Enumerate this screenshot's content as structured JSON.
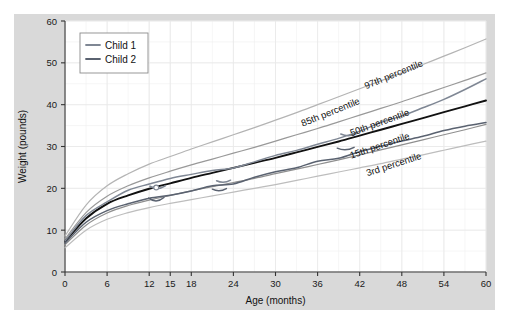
{
  "chart_data": {
    "type": "line",
    "title": "",
    "xlabel": "Age (months)",
    "ylabel": "Weight (pounds)",
    "xlim": [
      0,
      60
    ],
    "ylim": [
      0,
      60
    ],
    "xticks": [
      0,
      6,
      12,
      15,
      18,
      24,
      30,
      36,
      42,
      48,
      54,
      60
    ],
    "xtick_labels": [
      "0",
      "6",
      "12",
      "15",
      "18",
      "24",
      "30",
      "36",
      "42",
      "48",
      "54",
      "60"
    ],
    "yticks": [
      0,
      10,
      20,
      30,
      40,
      50,
      60
    ],
    "ytick_labels": [
      "0",
      "10",
      "20",
      "30",
      "40",
      "50",
      "60"
    ],
    "grid": true,
    "legend_position": "upper left",
    "x": [
      0,
      3,
      6,
      9,
      12,
      15,
      18,
      21,
      24,
      27,
      30,
      33,
      36,
      39,
      42,
      45,
      48,
      51,
      54,
      57,
      60
    ],
    "series": [
      {
        "name": "97th percentile",
        "role": "percentile",
        "color": "#b4b4b4",
        "label_text": "97th percentile",
        "values": [
          8.6,
          16.0,
          20.6,
          23.5,
          25.8,
          27.6,
          29.4,
          31.1,
          32.8,
          34.5,
          36.3,
          38.1,
          40.0,
          41.9,
          43.8,
          45.7,
          47.6,
          49.6,
          51.6,
          53.6,
          55.7
        ]
      },
      {
        "name": "85th percentile",
        "role": "percentile",
        "color": "#999999",
        "label_text": "85th percentile",
        "values": [
          7.9,
          14.2,
          18.1,
          20.6,
          22.5,
          24.1,
          25.6,
          27.0,
          28.4,
          29.8,
          31.3,
          32.8,
          34.3,
          35.9,
          37.5,
          39.1,
          40.7,
          42.4,
          44.1,
          45.8,
          47.6
        ]
      },
      {
        "name": "50th percentile",
        "role": "percentile",
        "color": "#111111",
        "label_text": "50th percentile",
        "values": [
          7.3,
          12.8,
          16.3,
          18.3,
          19.9,
          21.2,
          22.5,
          23.7,
          24.9,
          26.1,
          27.3,
          28.6,
          29.9,
          31.2,
          32.6,
          34.0,
          35.4,
          36.8,
          38.2,
          39.6,
          41.0
        ]
      },
      {
        "name": "15th percentile",
        "role": "percentile",
        "color": "#8f8f8f",
        "label_text": "15th percentile",
        "values": [
          6.5,
          11.2,
          14.1,
          15.9,
          17.2,
          18.3,
          19.4,
          20.4,
          21.4,
          22.4,
          23.5,
          24.6,
          25.7,
          26.8,
          28.0,
          29.2,
          30.4,
          31.6,
          32.8,
          34.0,
          35.3
        ]
      },
      {
        "name": "3rd percentile",
        "role": "percentile",
        "color": "#bdbdbd",
        "label_text": "3rd percentile",
        "values": [
          5.8,
          10.0,
          12.6,
          14.2,
          15.4,
          16.4,
          17.3,
          18.2,
          19.1,
          20.0,
          20.9,
          21.9,
          22.9,
          23.9,
          24.9,
          25.9,
          27.0,
          28.0,
          29.1,
          30.2,
          31.3
        ]
      },
      {
        "name": "Child 1",
        "role": "child",
        "color": "#7f8794",
        "values": [
          7.4,
          13.2,
          17.0,
          19.3,
          21.0,
          22.1,
          23.2,
          24.2,
          25.0,
          26.4,
          27.8,
          29.2,
          30.7,
          32.2,
          33.7,
          35.6,
          37.5,
          39.4,
          41.4,
          43.6,
          45.9
        ]
      },
      {
        "name": "Child 2",
        "role": "child",
        "color": "#5a6270",
        "values": [
          6.9,
          11.8,
          14.8,
          16.6,
          17.9,
          18.2,
          19.3,
          20.4,
          21.3,
          22.5,
          23.8,
          25.0,
          26.3,
          27.4,
          28.9,
          30.2,
          31.5,
          32.7,
          33.9,
          34.9,
          35.9
        ]
      }
    ],
    "marker_points": [
      {
        "series": "Child 1",
        "x": 13,
        "y": 20.2
      }
    ],
    "annotations": [
      {
        "text": "97th percentile",
        "x": 47,
        "y": 46.5,
        "rotation": -22
      },
      {
        "text": "85th percentile",
        "x": 38,
        "y": 37.5,
        "rotation": -22
      },
      {
        "text": "50th percentile",
        "x": 45,
        "y": 35.0,
        "rotation": -20
      },
      {
        "text": "15th percentile",
        "x": 45,
        "y": 29.5,
        "rotation": -19
      },
      {
        "text": "3rd percentile",
        "x": 47,
        "y": 25.0,
        "rotation": -18
      }
    ]
  },
  "legend": {
    "items": [
      {
        "label": "Child 1",
        "color": "#7f8794"
      },
      {
        "label": "Child 2",
        "color": "#5a6270"
      }
    ]
  },
  "colors": {
    "figure_background": "#d9d9d9",
    "plot_background": "#ffffff",
    "grid": "#e8e8e8",
    "axis": "#333333",
    "text": "#111111"
  }
}
